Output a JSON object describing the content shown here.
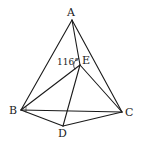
{
  "diagram": {
    "type": "geometry",
    "stroke_color": "#1a1a1a",
    "points": {
      "A": {
        "label": "A",
        "x": 72,
        "y": 20
      },
      "B": {
        "label": "B",
        "x": 21,
        "y": 110
      },
      "C": {
        "label": "C",
        "x": 122,
        "y": 112
      },
      "D": {
        "label": "D",
        "x": 63,
        "y": 126
      },
      "E": {
        "label": "E",
        "x": 80,
        "y": 65
      }
    },
    "segments": [
      "AB",
      "AC",
      "AE",
      "BC",
      "BE",
      "CE",
      "BD",
      "CD",
      "DE"
    ],
    "angle_annotation": {
      "text": "116°",
      "vertex": "E",
      "between": [
        "A",
        "B"
      ]
    }
  }
}
